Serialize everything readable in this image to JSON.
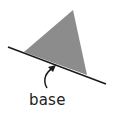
{
  "diagram": {
    "type": "geometry-figure",
    "shape": "triangle",
    "label": "base",
    "colors": {
      "triangle_fill": "#8c8c8c",
      "line": "#1a1a1a",
      "text": "#222222"
    },
    "triangle_points": "73,10 25,52 87,75",
    "base_line": {
      "x1": 8,
      "y1": 47,
      "x2": 106,
      "y2": 84
    }
  }
}
